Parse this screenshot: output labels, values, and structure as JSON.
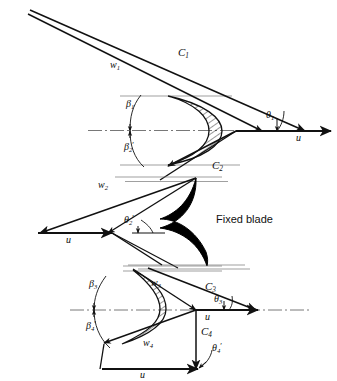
{
  "figure": {
    "fixed_blade_label": "Fixed blade",
    "colors": {
      "line": "#111111",
      "hatch": "#1a1a1a",
      "fill_black": "#000000",
      "centerline": "#555555",
      "background": "#ffffff"
    }
  },
  "stages": [
    {
      "name": "first-moving-row",
      "labels": {
        "c_in": {
          "base": "C",
          "sub": "1",
          "prime": ""
        },
        "w_in": {
          "base": "w",
          "sub": "1",
          "prime": ""
        },
        "beta_in": {
          "base": "β",
          "sub": "1",
          "prime": ""
        },
        "beta_out": {
          "base": "β",
          "sub": "2",
          "prime": "′"
        },
        "theta_in": {
          "base": "θ",
          "sub": "1",
          "prime": ""
        },
        "c_out": {
          "base": "C",
          "sub": "2",
          "prime": ""
        },
        "u": {
          "base": "u",
          "sub": "",
          "prime": ""
        }
      }
    },
    {
      "name": "fixed-row",
      "labels": {
        "w_in": {
          "base": "w",
          "sub": "2",
          "prime": ""
        },
        "theta_out": {
          "base": "θ",
          "sub": "2",
          "prime": "′"
        },
        "u": {
          "base": "u",
          "sub": "",
          "prime": ""
        }
      }
    },
    {
      "name": "second-moving-row",
      "labels": {
        "beta_in": {
          "base": "β",
          "sub": "3",
          "prime": ""
        },
        "beta_out": {
          "base": "β",
          "sub": "4",
          "prime": "′"
        },
        "w_in": {
          "base": "w",
          "sub": "3",
          "prime": ""
        },
        "w_out": {
          "base": "w",
          "sub": "4",
          "prime": ""
        },
        "c_in": {
          "base": "C",
          "sub": "3",
          "prime": ""
        },
        "c_out": {
          "base": "C",
          "sub": "4",
          "prime": ""
        },
        "theta_in": {
          "base": "θ",
          "sub": "3",
          "prime": ""
        },
        "theta_out": {
          "base": "θ",
          "sub": "4",
          "prime": "′"
        },
        "u_top": {
          "base": "u",
          "sub": "",
          "prime": ""
        },
        "u_bottom": {
          "base": "u",
          "sub": "",
          "prime": ""
        }
      }
    }
  ],
  "annotations": {
    "C1": "C1",
    "w1": "w1",
    "beta1": "β1",
    "beta2p": "β2′",
    "theta1": "θ1",
    "u1": "u",
    "C2": "C2",
    "w2": "w2",
    "theta2p": "θ2′",
    "u2": "u",
    "beta3": "β3",
    "beta4p": "β4′",
    "w3": "w3",
    "w4": "w4",
    "C3": "C3",
    "C4": "C4",
    "theta3": "θ3",
    "theta4p": "θ4′",
    "u3": "u",
    "u4": "u"
  }
}
